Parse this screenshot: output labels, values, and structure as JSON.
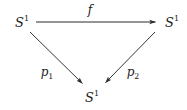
{
  "diagram": {
    "type": "commutative-triangle",
    "stroke_color": "#2b2b2b",
    "background_color": "#ffffff",
    "nodes": [
      {
        "id": "source",
        "symbol": "S",
        "superscript": "1",
        "x": 22,
        "y": 22
      },
      {
        "id": "target",
        "symbol": "S",
        "superscript": "1",
        "x": 172,
        "y": 22
      },
      {
        "id": "base",
        "symbol": "S",
        "superscript": "1",
        "x": 92,
        "y": 97
      }
    ],
    "edges": [
      {
        "id": "f",
        "label": "f",
        "subscript": "",
        "from": "source",
        "to": "target",
        "label_x": 90,
        "label_y": 10,
        "x1": 36,
        "y1": 22,
        "x2": 157,
        "y2": 22
      },
      {
        "id": "p1",
        "label": "p",
        "subscript": "1",
        "from": "source",
        "to": "base",
        "label_x": 47,
        "label_y": 72,
        "x1": 30,
        "y1": 32,
        "x2": 84,
        "y2": 85
      },
      {
        "id": "p2",
        "label": "p",
        "subscript": "2",
        "from": "target",
        "to": "base",
        "label_x": 133,
        "label_y": 72,
        "x1": 155,
        "y1": 32,
        "x2": 104,
        "y2": 84
      }
    ]
  }
}
